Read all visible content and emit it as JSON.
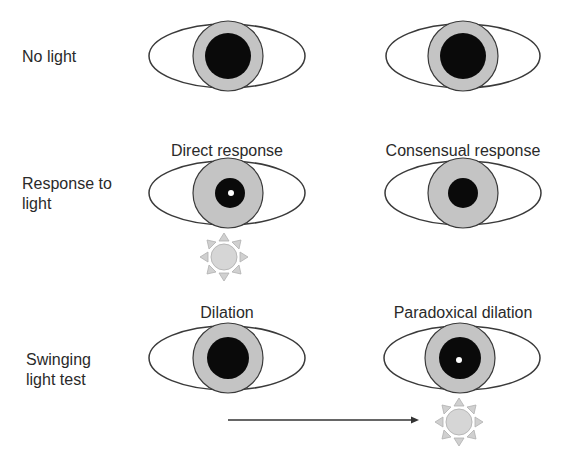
{
  "rows": [
    {
      "label": "No light",
      "left": {
        "caption": "",
        "pupil": "large",
        "light": false
      },
      "right": {
        "caption": "",
        "pupil": "large",
        "light": false
      }
    },
    {
      "label_line1": "Response to",
      "label_line2": "light",
      "left": {
        "caption": "Direct response",
        "pupil": "constricted",
        "light": true
      },
      "right": {
        "caption": "Consensual response",
        "pupil": "constricted",
        "light": false
      }
    },
    {
      "label_line1": "Swinging",
      "label_line2": "light test",
      "left": {
        "caption": "Dilation",
        "pupil": "large",
        "light": false
      },
      "right": {
        "caption": "Paradoxical dilation",
        "pupil": "large",
        "light": true
      }
    }
  ],
  "colors": {
    "sclera_outline": "#3a3a3a",
    "iris": "#c4c4c4",
    "pupil": "#0a0a0a",
    "sun_fill": "#d6d6d6",
    "sun_rays": "#bdbdbd",
    "arrow": "#333333"
  },
  "arrow": {
    "direction": "left-to-right",
    "meaning": "light swung from left eye to right eye"
  }
}
